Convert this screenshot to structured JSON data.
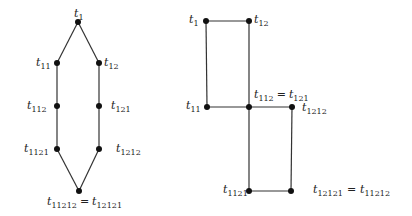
{
  "diagrams": [
    {
      "name": "left-graph",
      "nodes": [
        {
          "id": "t1",
          "x": 78,
          "y": 22,
          "label": "t",
          "sub": "1"
        },
        {
          "id": "t11",
          "x": 57,
          "y": 63,
          "label": "t",
          "sub": "11"
        },
        {
          "id": "t12",
          "x": 99,
          "y": 63,
          "label": "t",
          "sub": "12"
        },
        {
          "id": "t112",
          "x": 57,
          "y": 106,
          "label": "t",
          "sub": "112"
        },
        {
          "id": "t121",
          "x": 99,
          "y": 106,
          "label": "t",
          "sub": "121"
        },
        {
          "id": "t1121",
          "x": 57,
          "y": 149,
          "label": "t",
          "sub": "1121"
        },
        {
          "id": "t1212",
          "x": 99,
          "y": 149,
          "label": "t",
          "sub": "1212"
        },
        {
          "id": "t11212",
          "x": 79,
          "y": 191,
          "label": "t",
          "sub": "11212",
          "eq_label": "t",
          "eq_sub": "12121"
        }
      ],
      "edges": [
        [
          "t1",
          "t11"
        ],
        [
          "t1",
          "t12"
        ],
        [
          "t11",
          "t112"
        ],
        [
          "t12",
          "t121"
        ],
        [
          "t112",
          "t1121"
        ],
        [
          "t121",
          "t1212"
        ],
        [
          "t1121",
          "t11212"
        ],
        [
          "t1212",
          "t11212"
        ]
      ]
    },
    {
      "name": "right-graph",
      "nodes": [
        {
          "id": "t1",
          "x": 206,
          "y": 21,
          "label": "t",
          "sub": "1"
        },
        {
          "id": "t12",
          "x": 249,
          "y": 21,
          "label": "t",
          "sub": "12"
        },
        {
          "id": "t11",
          "x": 207,
          "y": 107,
          "label": "t",
          "sub": "11"
        },
        {
          "id": "t112",
          "x": 249,
          "y": 107,
          "label": "t",
          "sub": "112",
          "eq_label": "t",
          "eq_sub": "121"
        },
        {
          "id": "t1212",
          "x": 292,
          "y": 107,
          "label": "t",
          "sub": "1212"
        },
        {
          "id": "t1121",
          "x": 249,
          "y": 191,
          "label": "t",
          "sub": "1121"
        },
        {
          "id": "t12121",
          "x": 291,
          "y": 191,
          "label": "t",
          "sub": "12121",
          "eq_label": "t",
          "eq_sub": "11212"
        }
      ],
      "edges": [
        [
          "t1",
          "t12"
        ],
        [
          "t1",
          "t11"
        ],
        [
          "t12",
          "t112"
        ],
        [
          "t11",
          "t112"
        ],
        [
          "t112",
          "t1212"
        ],
        [
          "t112",
          "t1121"
        ],
        [
          "t1212",
          "t12121"
        ],
        [
          "t1121",
          "t12121"
        ]
      ]
    }
  ],
  "labels": {
    "eq": "="
  }
}
